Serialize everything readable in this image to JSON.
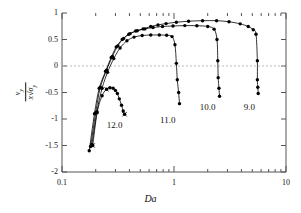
{
  "chart_data": {
    "type": "line",
    "title": "",
    "xlabel": "Da",
    "ylabel": "v_y / sqrt(x sigma_y)",
    "ylabel_numerator": "v",
    "ylabel_numerator_sub": "y",
    "ylabel_denominator_prefix": "x",
    "ylabel_denominator_sigma": "σ",
    "ylabel_denominator_sub": "y",
    "xscale": "log",
    "xlim": [
      0.1,
      10
    ],
    "ylim": [
      -2,
      1
    ],
    "grid": false,
    "zero_line": true,
    "zero_line_style": "dashed",
    "zero_line_color": "#bbbbbb",
    "xticks": [
      0.1,
      1,
      10
    ],
    "xtick_labels": [
      "0.1",
      "1",
      "10"
    ],
    "yticks": [
      1,
      0.5,
      0,
      -0.5,
      -1,
      -1.5,
      -2
    ],
    "ytick_labels": [
      "1",
      "0.5",
      "0",
      "-0.5",
      "-1",
      "-1.5",
      "-2"
    ],
    "marker": "filled-circle",
    "marker_color": "#000000",
    "line_color": "#000000",
    "legend_position": "inline-annotations",
    "series": [
      {
        "name": "9.0",
        "label": "9.0",
        "label_x": 4.7,
        "label_y": -0.78,
        "points": [
          [
            0.175,
            -1.6
          ],
          [
            0.195,
            -0.9
          ],
          [
            0.215,
            -0.42
          ],
          [
            0.245,
            -0.1
          ],
          [
            0.275,
            0.16
          ],
          [
            0.305,
            0.36
          ],
          [
            0.345,
            0.5
          ],
          [
            0.395,
            0.6
          ],
          [
            0.455,
            0.66
          ],
          [
            0.53,
            0.7
          ],
          [
            0.62,
            0.745
          ],
          [
            0.72,
            0.775
          ],
          [
            0.85,
            0.8
          ],
          [
            1.05,
            0.825
          ],
          [
            1.35,
            0.845
          ],
          [
            1.8,
            0.855
          ],
          [
            2.4,
            0.855
          ],
          [
            3.1,
            0.835
          ],
          [
            3.9,
            0.795
          ],
          [
            4.6,
            0.745
          ],
          [
            5.1,
            0.685
          ],
          [
            5.4,
            0.6
          ],
          [
            5.55,
            0.1
          ],
          [
            5.55,
            -0.26
          ],
          [
            5.6,
            -0.4
          ],
          [
            5.65,
            -0.52
          ]
        ]
      },
      {
        "name": "10.0",
        "label": "10.0",
        "label_x": 2.0,
        "label_y": -0.78,
        "points": [
          [
            0.18,
            -1.52
          ],
          [
            0.2,
            -0.88
          ],
          [
            0.22,
            -0.4
          ],
          [
            0.25,
            -0.08
          ],
          [
            0.282,
            0.18
          ],
          [
            0.315,
            0.38
          ],
          [
            0.355,
            0.52
          ],
          [
            0.405,
            0.61
          ],
          [
            0.47,
            0.665
          ],
          [
            0.55,
            0.7
          ],
          [
            0.65,
            0.725
          ],
          [
            0.79,
            0.745
          ],
          [
            0.98,
            0.755
          ],
          [
            1.25,
            0.762
          ],
          [
            1.6,
            0.76
          ],
          [
            2.0,
            0.745
          ],
          [
            2.28,
            0.695
          ],
          [
            2.42,
            0.5
          ],
          [
            2.46,
            0.1
          ],
          [
            2.48,
            -0.22
          ],
          [
            2.52,
            -0.42
          ],
          [
            2.55,
            -0.57
          ]
        ]
      },
      {
        "name": "11.0",
        "label": "11.0",
        "label_x": 0.88,
        "label_y": -1.02,
        "points": [
          [
            0.185,
            -1.48
          ],
          [
            0.205,
            -0.86
          ],
          [
            0.228,
            -0.42
          ],
          [
            0.255,
            -0.12
          ],
          [
            0.29,
            0.14
          ],
          [
            0.33,
            0.34
          ],
          [
            0.38,
            0.475
          ],
          [
            0.44,
            0.545
          ],
          [
            0.52,
            0.575
          ],
          [
            0.62,
            0.585
          ],
          [
            0.74,
            0.585
          ],
          [
            0.86,
            0.58
          ],
          [
            0.96,
            0.555
          ],
          [
            1.02,
            0.4
          ],
          [
            1.05,
            0.05
          ],
          [
            1.07,
            -0.26
          ],
          [
            1.1,
            -0.5
          ],
          [
            1.12,
            -0.71
          ]
        ]
      },
      {
        "name": "12.0",
        "label": "12.0",
        "label_x": 0.295,
        "label_y": -1.12,
        "points": [
          [
            0.188,
            -1.5
          ],
          [
            0.206,
            -0.88
          ],
          [
            0.228,
            -0.56
          ],
          [
            0.25,
            -0.44
          ],
          [
            0.268,
            -0.41
          ],
          [
            0.286,
            -0.42
          ],
          [
            0.3,
            -0.46
          ],
          [
            0.312,
            -0.52
          ],
          [
            0.325,
            -0.62
          ],
          [
            0.34,
            -0.74
          ],
          [
            0.352,
            -0.85
          ],
          [
            0.362,
            -0.91
          ]
        ]
      }
    ],
    "extra_markers": [
      {
        "x": 0.188,
        "y": -1.5,
        "shape": "x"
      },
      {
        "x": 0.25,
        "y": -0.44,
        "shape": "x"
      },
      {
        "x": 0.362,
        "y": -0.91,
        "shape": "x"
      }
    ]
  }
}
